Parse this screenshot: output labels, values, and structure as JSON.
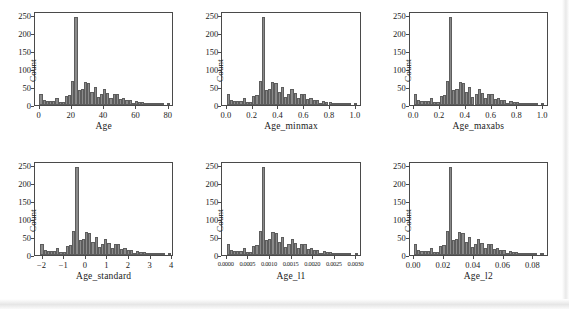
{
  "figure": {
    "rows": 2,
    "cols": 3,
    "bar_color": "#8a8a8a",
    "bar_edge_color": "#5d5d5d",
    "axis_color": "#4a4a4a",
    "background": "#ffffff"
  },
  "chart_data": [
    {
      "type": "bar",
      "title": "",
      "xlabel": "Age",
      "ylabel": "Count",
      "xlim": [
        -2.8,
        83.5
      ],
      "ylim": [
        0,
        262
      ],
      "xticks": [
        0,
        20,
        40,
        60,
        80
      ],
      "xticklabels": [
        "0",
        "20",
        "40",
        "60",
        "80"
      ],
      "yticks": [
        0,
        50,
        100,
        150,
        200,
        250
      ],
      "yticklabels": [
        "0",
        "50",
        "100",
        "150",
        "200",
        "250"
      ],
      "grid": false,
      "legend": false,
      "bin_width": 2.0,
      "bin_starts": [
        0,
        2,
        4,
        6,
        8,
        10,
        12,
        14,
        16,
        18,
        20,
        22,
        24,
        26,
        28,
        30,
        32,
        34,
        36,
        38,
        40,
        42,
        44,
        46,
        48,
        50,
        52,
        54,
        56,
        58,
        60,
        62,
        64,
        66,
        68,
        70,
        72,
        74,
        76,
        78,
        80
      ],
      "values": [
        31,
        13,
        12,
        12,
        11,
        19,
        8,
        9,
        25,
        28,
        67,
        250,
        43,
        45,
        65,
        63,
        38,
        51,
        22,
        30,
        45,
        35,
        21,
        30,
        31,
        17,
        21,
        13,
        13,
        6,
        11,
        10,
        9,
        2,
        1,
        2,
        3,
        1,
        1,
        0,
        1
      ]
    },
    {
      "type": "bar",
      "title": "",
      "xlabel": "Age_minmax",
      "ylabel": "Count",
      "xlim": [
        -0.035,
        1.045
      ],
      "ylim": [
        0,
        262
      ],
      "xticks": [
        0.0,
        0.2,
        0.4,
        0.6,
        0.8,
        1.0
      ],
      "xticklabels": [
        "0.0",
        "0.2",
        "0.4",
        "0.6",
        "0.8",
        "1.0"
      ],
      "yticks": [
        0,
        50,
        100,
        150,
        200,
        250
      ],
      "yticklabels": [
        "0",
        "50",
        "100",
        "150",
        "200",
        "250"
      ],
      "grid": false,
      "legend": false,
      "bin_width": 0.025,
      "bin_starts": [
        0.0,
        0.025,
        0.05,
        0.075,
        0.1,
        0.125,
        0.15,
        0.175,
        0.2,
        0.225,
        0.25,
        0.275,
        0.3,
        0.325,
        0.35,
        0.375,
        0.4,
        0.425,
        0.45,
        0.475,
        0.5,
        0.525,
        0.55,
        0.575,
        0.6,
        0.625,
        0.65,
        0.675,
        0.7,
        0.725,
        0.75,
        0.775,
        0.8,
        0.825,
        0.85,
        0.875,
        0.9,
        0.925,
        0.95,
        0.975,
        1.0
      ],
      "values": [
        31,
        13,
        12,
        12,
        11,
        19,
        8,
        9,
        25,
        28,
        67,
        250,
        43,
        45,
        65,
        63,
        38,
        51,
        22,
        30,
        45,
        35,
        21,
        30,
        31,
        17,
        21,
        13,
        13,
        6,
        11,
        10,
        9,
        2,
        1,
        2,
        3,
        1,
        1,
        0,
        1
      ]
    },
    {
      "type": "bar",
      "title": "",
      "xlabel": "Age_maxabs",
      "ylabel": "Count",
      "xlim": [
        -0.035,
        1.045
      ],
      "ylim": [
        0,
        262
      ],
      "xticks": [
        0.0,
        0.2,
        0.4,
        0.6,
        0.8,
        1.0
      ],
      "xticklabels": [
        "0.0",
        "0.2",
        "0.4",
        "0.6",
        "0.8",
        "1.0"
      ],
      "yticks": [
        0,
        50,
        100,
        150,
        200,
        250
      ],
      "yticklabels": [
        "0",
        "50",
        "100",
        "150",
        "200",
        "250"
      ],
      "grid": false,
      "legend": false,
      "bin_width": 0.025,
      "bin_starts": [
        0.0,
        0.025,
        0.05,
        0.075,
        0.1,
        0.125,
        0.15,
        0.175,
        0.2,
        0.225,
        0.25,
        0.275,
        0.3,
        0.325,
        0.35,
        0.375,
        0.4,
        0.425,
        0.45,
        0.475,
        0.5,
        0.525,
        0.55,
        0.575,
        0.6,
        0.625,
        0.65,
        0.675,
        0.7,
        0.725,
        0.75,
        0.775,
        0.8,
        0.825,
        0.85,
        0.875,
        0.9,
        0.925,
        0.95,
        0.975,
        1.0
      ],
      "values": [
        31,
        13,
        12,
        12,
        11,
        19,
        8,
        9,
        25,
        28,
        67,
        250,
        43,
        45,
        65,
        63,
        38,
        51,
        22,
        30,
        45,
        35,
        21,
        30,
        31,
        17,
        21,
        13,
        13,
        6,
        11,
        10,
        9,
        2,
        1,
        2,
        3,
        1,
        1,
        0,
        1
      ]
    },
    {
      "type": "bar",
      "title": "",
      "xlabel": "Age_standard",
      "ylabel": "Count",
      "xlim": [
        -2.35,
        4.1
      ],
      "ylim": [
        0,
        262
      ],
      "xticks": [
        -2,
        -1,
        0,
        1,
        2,
        3,
        4
      ],
      "xticklabels": [
        "−2",
        "−1",
        "0",
        "1",
        "2",
        "3",
        "4"
      ],
      "yticks": [
        0,
        50,
        100,
        150,
        200,
        250
      ],
      "yticklabels": [
        "0",
        "50",
        "100",
        "150",
        "200",
        "250"
      ],
      "grid": false,
      "legend": false,
      "bin_width": 0.15,
      "bin_starts": [
        -2.1,
        -1.95,
        -1.8,
        -1.65,
        -1.5,
        -1.35,
        -1.2,
        -1.05,
        -0.9,
        -0.75,
        -0.6,
        -0.45,
        -0.3,
        -0.15,
        0.0,
        0.15,
        0.3,
        0.45,
        0.6,
        0.75,
        0.9,
        1.05,
        1.2,
        1.35,
        1.5,
        1.65,
        1.8,
        1.95,
        2.1,
        2.25,
        2.4,
        2.55,
        2.7,
        2.85,
        3.0,
        3.15,
        3.3,
        3.45,
        3.6,
        3.75,
        3.9
      ],
      "values": [
        31,
        13,
        12,
        12,
        11,
        19,
        8,
        9,
        25,
        28,
        67,
        250,
        43,
        45,
        65,
        63,
        38,
        51,
        22,
        30,
        45,
        35,
        21,
        30,
        31,
        17,
        21,
        13,
        13,
        6,
        11,
        10,
        9,
        2,
        1,
        2,
        3,
        1,
        1,
        0,
        1
      ]
    },
    {
      "type": "bar",
      "title": "",
      "xlabel": "Age_l1",
      "ylabel": "Count",
      "xlim": [
        -0.0001,
        0.00312
      ],
      "ylim": [
        0,
        262
      ],
      "xticks": [
        0.0,
        0.0005,
        0.001,
        0.0015,
        0.002,
        0.0025,
        0.003
      ],
      "xticklabels": [
        "0.0000",
        "0.0005",
        "0.0010",
        "0.0015",
        "0.0020",
        "0.0025",
        "0.0030"
      ],
      "yticks": [
        0,
        50,
        100,
        150,
        200,
        250
      ],
      "yticklabels": [
        "0",
        "50",
        "100",
        "150",
        "200",
        "250"
      ],
      "grid": false,
      "legend": false,
      "bin_width": 7.5e-05,
      "bin_starts": [
        0.0,
        7.5e-05,
        0.00015,
        0.000225,
        0.0003,
        0.000375,
        0.00045,
        0.000525,
        0.0006,
        0.000675,
        0.00075,
        0.000825,
        0.0009,
        0.000975,
        0.00105,
        0.001125,
        0.0012,
        0.001275,
        0.00135,
        0.001425,
        0.0015,
        0.001575,
        0.00165,
        0.001725,
        0.0018,
        0.001875,
        0.00195,
        0.002025,
        0.0021,
        0.002175,
        0.00225,
        0.002325,
        0.0024,
        0.002475,
        0.00255,
        0.002625,
        0.0027,
        0.002775,
        0.00285,
        0.002925,
        0.003
      ],
      "values": [
        31,
        13,
        12,
        12,
        11,
        19,
        8,
        9,
        25,
        28,
        67,
        250,
        43,
        45,
        65,
        63,
        38,
        51,
        22,
        30,
        45,
        35,
        21,
        30,
        31,
        17,
        21,
        13,
        13,
        6,
        11,
        10,
        9,
        2,
        1,
        2,
        3,
        1,
        1,
        0,
        1
      ]
    },
    {
      "type": "bar",
      "title": "",
      "xlabel": "Age_l2",
      "ylabel": "Count",
      "xlim": [
        -0.003,
        0.0905
      ],
      "ylim": [
        0,
        262
      ],
      "xticks": [
        0.0,
        0.02,
        0.04,
        0.06,
        0.08
      ],
      "xticklabels": [
        "0.00",
        "0.02",
        "0.04",
        "0.06",
        "0.08"
      ],
      "yticks": [
        0,
        50,
        100,
        150,
        200,
        250
      ],
      "yticklabels": [
        "0",
        "50",
        "100",
        "150",
        "200",
        "250"
      ],
      "grid": false,
      "legend": false,
      "bin_width": 0.00215,
      "bin_starts": [
        0.0,
        0.00215,
        0.0043,
        0.00645,
        0.0086,
        0.01075,
        0.0129,
        0.01505,
        0.0172,
        0.01935,
        0.0215,
        0.02365,
        0.0258,
        0.02795,
        0.0301,
        0.03225,
        0.0344,
        0.03655,
        0.0387,
        0.04085,
        0.043,
        0.04515,
        0.0473,
        0.04945,
        0.0516,
        0.05375,
        0.0559,
        0.05805,
        0.0602,
        0.06235,
        0.0645,
        0.06665,
        0.0688,
        0.07095,
        0.0731,
        0.07525,
        0.0774,
        0.07955,
        0.0817,
        0.08385,
        0.086
      ],
      "values": [
        31,
        13,
        12,
        12,
        11,
        19,
        8,
        9,
        25,
        28,
        67,
        250,
        43,
        45,
        65,
        63,
        38,
        51,
        22,
        30,
        45,
        35,
        21,
        30,
        31,
        17,
        21,
        13,
        13,
        6,
        11,
        10,
        9,
        2,
        1,
        2,
        3,
        1,
        1,
        0,
        1
      ]
    }
  ]
}
